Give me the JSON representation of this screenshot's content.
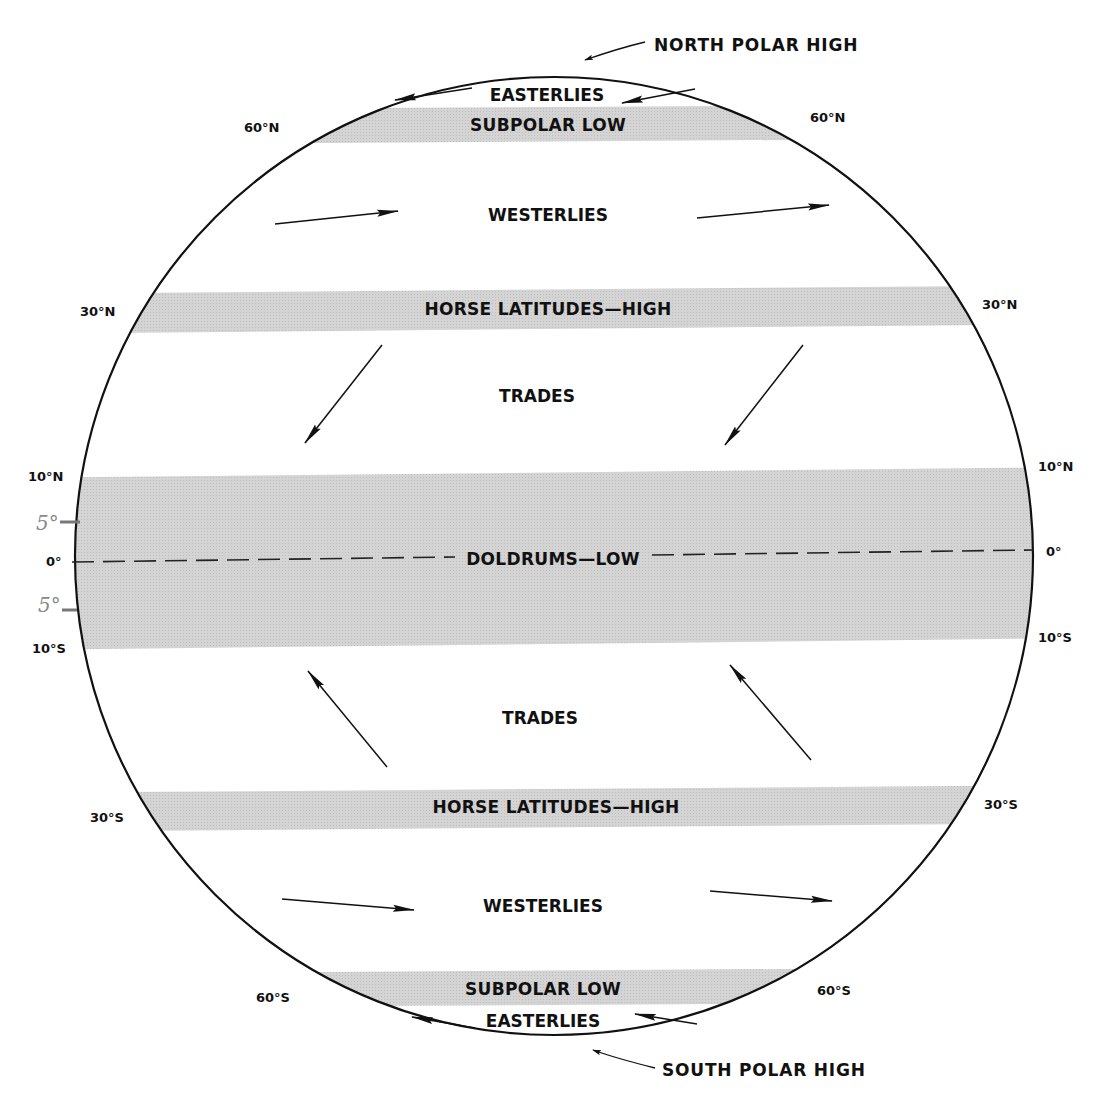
{
  "diagram": {
    "colors": {
      "background": "#ffffff",
      "band_fill": "#d2d2d2",
      "ink": "#111111",
      "pencil": "#8a8a8a"
    },
    "pole_labels": {
      "north": "NORTH POLAR HIGH",
      "south": "SOUTH POLAR HIGH"
    },
    "bands": [
      {
        "id": "north-subpolar-low",
        "label": "SUBPOLAR LOW"
      },
      {
        "id": "north-horse-latitudes",
        "label": "HORSE LATITUDES—HIGH"
      },
      {
        "id": "doldrums",
        "label": "DOLDRUMS—LOW"
      },
      {
        "id": "south-horse-latitudes",
        "label": "HORSE LATITUDES—HIGH"
      },
      {
        "id": "south-subpolar-low",
        "label": "SUBPOLAR LOW"
      }
    ],
    "winds": [
      {
        "id": "north-easterlies",
        "label": "EASTERLIES"
      },
      {
        "id": "north-westerlies",
        "label": "WESTERLIES"
      },
      {
        "id": "north-trades",
        "label": "TRADES"
      },
      {
        "id": "south-trades",
        "label": "TRADES"
      },
      {
        "id": "south-westerlies",
        "label": "WESTERLIES"
      },
      {
        "id": "south-easterlies",
        "label": "EASTERLIES"
      }
    ],
    "latitude_labels": {
      "n60_left": "60°N",
      "n60_right": "60°N",
      "n30_left": "30°N",
      "n30_right": "30°N",
      "n10_left": "10°N",
      "n10_right": "10°N",
      "eq_left": "0°",
      "eq_right": "0°",
      "s10_left": "10°S",
      "s10_right": "10°S",
      "s30_left": "30°S",
      "s30_right": "30°S",
      "s60_left": "60°S",
      "s60_right": "60°S"
    },
    "annotations": {
      "pencil_north": "5°",
      "pencil_south": "5°"
    }
  }
}
